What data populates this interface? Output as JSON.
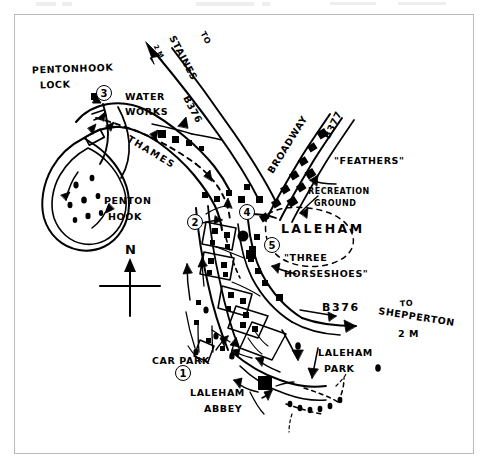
{
  "document": {
    "title": "Laleham and Penton Hook sketch map",
    "frame_color": "#b9b9b9",
    "ink_color": "#000000",
    "background": "#ffffff"
  },
  "map": {
    "river_label": "THAMES",
    "place_labels": [
      {
        "id": "pentonhook-lock",
        "line1": "PENTONHOOK",
        "line2": "LOCK"
      },
      {
        "id": "water-works",
        "line1": "WATER",
        "line2": "WORKS"
      },
      {
        "id": "penton-hook",
        "line1": "PENTON",
        "line2": "HOOK"
      },
      {
        "id": "laleham",
        "text": "LALEHAM"
      },
      {
        "id": "recreation-ground",
        "line1": "RECREATION",
        "line2": "GROUND"
      },
      {
        "id": "feathers",
        "text": "\"FEATHERS\""
      },
      {
        "id": "three-horseshoes",
        "line1": "\"THREE",
        "line2": "HORSESHOES\""
      },
      {
        "id": "laleham-park",
        "line1": "LALEHAM",
        "line2": "PARK"
      },
      {
        "id": "laleham-abbey",
        "line1": "LALEHAM",
        "line2": "ABBEY"
      },
      {
        "id": "car-park",
        "text": "CAR PARK"
      }
    ],
    "road_labels": [
      {
        "id": "to-staines",
        "line1": "TO",
        "line2": "STAINES",
        "line3": "B376",
        "distance": "2 M."
      },
      {
        "id": "broadway",
        "text": "BROADWAY"
      },
      {
        "id": "b377",
        "text": "B377"
      },
      {
        "id": "b376-shepperton",
        "road": "B376",
        "line1": "TO",
        "line2": "SHEPPERTON",
        "distance": "2 M"
      }
    ],
    "numbered_markers": [
      {
        "number": "1",
        "near": "car-park"
      },
      {
        "number": "2",
        "near": "thames-riverside-west"
      },
      {
        "number": "3",
        "near": "pentonhook-lock"
      },
      {
        "number": "4",
        "near": "laleham-village-crossroads"
      },
      {
        "number": "5",
        "near": "three-horseshoes"
      }
    ],
    "compass": {
      "label": "N"
    }
  }
}
